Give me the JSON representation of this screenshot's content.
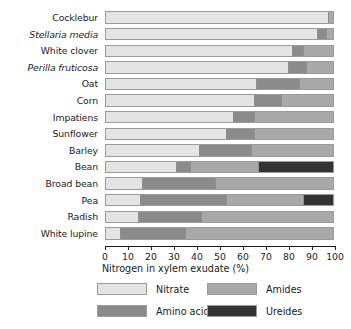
{
  "chart_data": {
    "type": "bar",
    "orientation": "horizontal",
    "stacked": true,
    "title": "",
    "xlabel": "Nitrogen in xylem exudate (%)",
    "ylabel": "",
    "xlim": [
      0,
      100
    ],
    "xticks": [
      0,
      10,
      20,
      30,
      40,
      50,
      60,
      70,
      80,
      90,
      100
    ],
    "xticklabels": [
      "0",
      "10",
      "20",
      "30",
      "40",
      "50",
      "60",
      "70",
      "80",
      "90",
      "100"
    ],
    "grid": false,
    "legend_position": "bottom",
    "categories": [
      "Cocklebur",
      "Stellaria media",
      "White clover",
      "Perilla fruticosa",
      "Oat",
      "Corn",
      "Impatiens",
      "Sunflower",
      "Barley",
      "Bean",
      "Broad bean",
      "Pea",
      "Radish",
      "White lupine"
    ],
    "category_styles": [
      "normal",
      "italic",
      "normal",
      "italic",
      "normal",
      "normal",
      "normal",
      "normal",
      "normal",
      "normal",
      "normal",
      "normal",
      "normal",
      "normal"
    ],
    "series": [
      {
        "name": "Nitrate",
        "color": "#e4e4e4",
        "values": [
          98,
          93,
          82,
          80,
          66,
          65,
          56,
          53,
          41,
          31,
          16,
          15,
          14,
          6
        ]
      },
      {
        "name": "Amino acids",
        "color": "#8b8b8b",
        "values": [
          0,
          4,
          5,
          8,
          19,
          12,
          9,
          12,
          23,
          6,
          32,
          38,
          28,
          29
        ]
      },
      {
        "name": "Amides",
        "color": "#a9a9a9",
        "values": [
          2,
          3,
          13,
          12,
          15,
          23,
          35,
          35,
          36,
          30,
          52,
          34,
          58,
          65
        ]
      },
      {
        "name": "Ureides",
        "color": "#333333",
        "values": [
          0,
          0,
          0,
          0,
          0,
          0,
          0,
          0,
          0,
          33,
          0,
          13,
          0,
          0
        ]
      }
    ]
  },
  "legend": {
    "entries": [
      {
        "label": "Nitrate",
        "color": "#e4e4e4"
      },
      {
        "label": "Amino acids",
        "color": "#8b8b8b"
      },
      {
        "label": "Amides",
        "color": "#a9a9a9"
      },
      {
        "label": "Ureides",
        "color": "#333333"
      }
    ]
  }
}
